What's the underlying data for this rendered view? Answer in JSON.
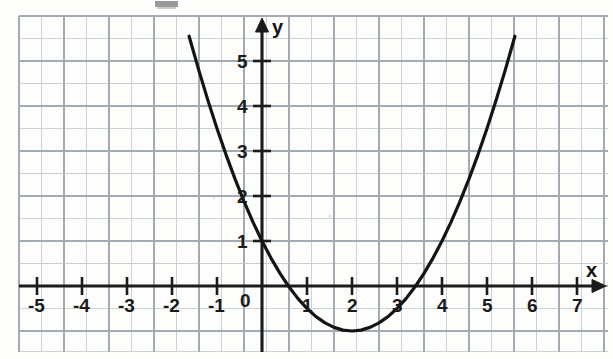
{
  "figure": {
    "kind": "graph-paper-parabola",
    "width_px": 613,
    "height_px": 359,
    "background_color": "#fdfdfc",
    "curve_color": "#141414",
    "axis_color": "#1b1b1b",
    "grid_minor_color": "#c9cfd6",
    "grid_major_color": "#9aa3ad",
    "grid_dotted_color": "#d7b9b9"
  },
  "axes": {
    "x_axis_label": "x",
    "y_axis_label": "y",
    "origin_label": "0",
    "x_tick_labels": [
      "-5",
      "-4",
      "-3",
      "-2",
      "-1",
      "1",
      "2",
      "3",
      "4",
      "5",
      "6",
      "7"
    ],
    "y_tick_labels": [
      "1",
      "2",
      "3",
      "4",
      "5"
    ]
  },
  "chart_data": {
    "type": "line",
    "title": "",
    "xlabel": "x",
    "ylabel": "y",
    "grid": true,
    "legend": "none",
    "xlim": [
      -5.4,
      7.8
    ],
    "ylim": [
      -1.6,
      5.9
    ],
    "xticks": [
      -5,
      -4,
      -3,
      -2,
      -1,
      0,
      1,
      2,
      3,
      4,
      5,
      6,
      7
    ],
    "yticks": [
      1,
      2,
      3,
      4,
      5
    ],
    "grid_minor_step": 0.5,
    "grid_major_step": 1,
    "series": [
      {
        "name": "parabola",
        "equation": "y = 0.5(x - 2)^2 - 1",
        "expanded": "y = 0.5x^2 - 2x + 1",
        "vertex": [
          2,
          -1
        ],
        "y_intercept": [
          0,
          1
        ],
        "x_intercepts": [
          0.586,
          3.414
        ],
        "x": [
          -1.62,
          -1.4,
          -1.2,
          -1.0,
          -0.8,
          -0.6,
          -0.4,
          -0.2,
          0.0,
          0.2,
          0.4,
          0.586,
          0.8,
          1.0,
          1.2,
          1.4,
          1.6,
          1.8,
          2.0,
          2.2,
          2.4,
          2.6,
          2.8,
          3.0,
          3.2,
          3.414,
          3.6,
          3.8,
          4.0,
          4.2,
          4.4,
          4.6,
          4.8,
          5.0,
          5.2,
          5.4,
          5.62
        ],
        "y": [
          5.55,
          4.78,
          4.12,
          3.5,
          2.92,
          2.38,
          1.88,
          1.42,
          1.0,
          0.62,
          0.28,
          0.0,
          -0.28,
          -0.5,
          -0.68,
          -0.82,
          -0.92,
          -0.98,
          -1.0,
          -0.98,
          -0.92,
          -0.82,
          -0.68,
          -0.5,
          -0.28,
          0.0,
          0.28,
          0.62,
          1.0,
          1.42,
          1.88,
          2.38,
          2.92,
          3.5,
          4.12,
          4.78,
          5.55
        ]
      }
    ]
  },
  "x_tick_items": [
    {
      "label": "-5",
      "value": -5
    },
    {
      "label": "-4",
      "value": -4
    },
    {
      "label": "-3",
      "value": -3
    },
    {
      "label": "-2",
      "value": -2
    },
    {
      "label": "-1",
      "value": -1
    },
    {
      "label": "1",
      "value": 1
    },
    {
      "label": "2",
      "value": 2
    },
    {
      "label": "3",
      "value": 3
    },
    {
      "label": "4",
      "value": 4
    },
    {
      "label": "5",
      "value": 5
    },
    {
      "label": "6",
      "value": 6
    },
    {
      "label": "7",
      "value": 7
    }
  ],
  "y_tick_items": [
    {
      "label": "1",
      "value": 1
    },
    {
      "label": "2",
      "value": 2
    },
    {
      "label": "3",
      "value": 3
    },
    {
      "label": "4",
      "value": 4
    },
    {
      "label": "5",
      "value": 5
    }
  ]
}
